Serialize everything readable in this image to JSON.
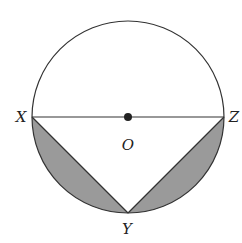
{
  "diagram": {
    "type": "geometry-circle-inscribed-triangle",
    "colors": {
      "stroke": "#333333",
      "shade": "#9a9a9a",
      "background": "#ffffff",
      "center_dot": "#222222"
    },
    "circle": {
      "cx": 128,
      "cy": 117,
      "r": 96
    },
    "points": {
      "X": {
        "label": "X",
        "x": 32,
        "y": 117,
        "label_x": 21,
        "label_y": 122
      },
      "Z": {
        "label": "Z",
        "x": 224,
        "y": 117,
        "label_x": 234,
        "label_y": 122
      },
      "O": {
        "label": "O",
        "x": 128,
        "y": 117,
        "label_x": 128,
        "label_y": 150
      },
      "Y": {
        "label": "Y",
        "x": 128,
        "y": 215,
        "label_x": 127,
        "label_y": 234
      }
    },
    "segments": [
      "XZ",
      "XY",
      "YZ"
    ],
    "shaded_regions": [
      "segment between chord XY and arc XY",
      "segment between chord YZ and arc YZ"
    ]
  }
}
